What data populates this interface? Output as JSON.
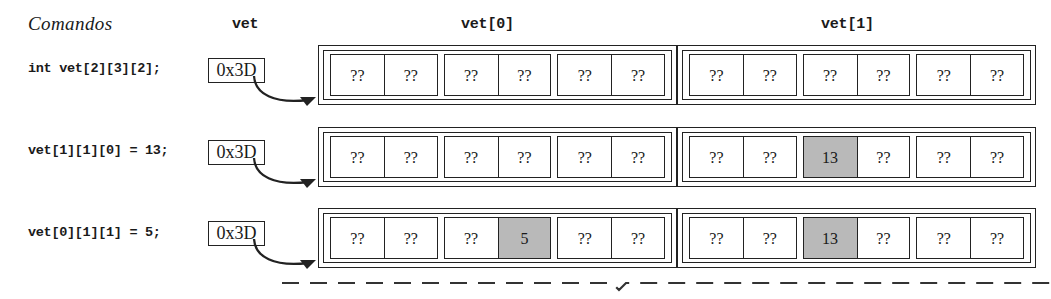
{
  "headers": {
    "commands_label": "Comandos",
    "pointer_label": "vet",
    "block0_label": "vet[0]",
    "block1_label": "vet[1]"
  },
  "colors": {
    "stroke": "#222222",
    "highlight": "#b9b9b9",
    "background": "#ffffff"
  },
  "rows": [
    {
      "command": "int vet[2][3][2];",
      "pointer_value": "0x3D",
      "blocks": [
        {
          "name": "vet[0]",
          "pairs": [
            {
              "cells": [
                {
                  "text": "??",
                  "highlighted": false
                },
                {
                  "text": "??",
                  "highlighted": false
                }
              ]
            },
            {
              "cells": [
                {
                  "text": "??",
                  "highlighted": false
                },
                {
                  "text": "??",
                  "highlighted": false
                }
              ]
            },
            {
              "cells": [
                {
                  "text": "??",
                  "highlighted": false
                },
                {
                  "text": "??",
                  "highlighted": false
                }
              ]
            }
          ]
        },
        {
          "name": "vet[1]",
          "pairs": [
            {
              "cells": [
                {
                  "text": "??",
                  "highlighted": false
                },
                {
                  "text": "??",
                  "highlighted": false
                }
              ]
            },
            {
              "cells": [
                {
                  "text": "??",
                  "highlighted": false
                },
                {
                  "text": "??",
                  "highlighted": false
                }
              ]
            },
            {
              "cells": [
                {
                  "text": "??",
                  "highlighted": false
                },
                {
                  "text": "??",
                  "highlighted": false
                }
              ]
            }
          ]
        }
      ]
    },
    {
      "command": "vet[1][1][0] = 13;",
      "pointer_value": "0x3D",
      "blocks": [
        {
          "name": "vet[0]",
          "pairs": [
            {
              "cells": [
                {
                  "text": "??",
                  "highlighted": false
                },
                {
                  "text": "??",
                  "highlighted": false
                }
              ]
            },
            {
              "cells": [
                {
                  "text": "??",
                  "highlighted": false
                },
                {
                  "text": "??",
                  "highlighted": false
                }
              ]
            },
            {
              "cells": [
                {
                  "text": "??",
                  "highlighted": false
                },
                {
                  "text": "??",
                  "highlighted": false
                }
              ]
            }
          ]
        },
        {
          "name": "vet[1]",
          "pairs": [
            {
              "cells": [
                {
                  "text": "??",
                  "highlighted": false
                },
                {
                  "text": "??",
                  "highlighted": false
                }
              ]
            },
            {
              "cells": [
                {
                  "text": "13",
                  "highlighted": true
                },
                {
                  "text": "??",
                  "highlighted": false
                }
              ]
            },
            {
              "cells": [
                {
                  "text": "??",
                  "highlighted": false
                },
                {
                  "text": "??",
                  "highlighted": false
                }
              ]
            }
          ]
        }
      ]
    },
    {
      "command": "vet[0][1][1] = 5;",
      "pointer_value": "0x3D",
      "blocks": [
        {
          "name": "vet[0]",
          "pairs": [
            {
              "cells": [
                {
                  "text": "??",
                  "highlighted": false
                },
                {
                  "text": "??",
                  "highlighted": false
                }
              ]
            },
            {
              "cells": [
                {
                  "text": "??",
                  "highlighted": false
                },
                {
                  "text": "5",
                  "highlighted": true
                }
              ]
            },
            {
              "cells": [
                {
                  "text": "??",
                  "highlighted": false
                },
                {
                  "text": "??",
                  "highlighted": false
                }
              ]
            }
          ]
        },
        {
          "name": "vet[1]",
          "pairs": [
            {
              "cells": [
                {
                  "text": "??",
                  "highlighted": false
                },
                {
                  "text": "??",
                  "highlighted": false
                }
              ]
            },
            {
              "cells": [
                {
                  "text": "13",
                  "highlighted": true
                },
                {
                  "text": "??",
                  "highlighted": false
                }
              ]
            },
            {
              "cells": [
                {
                  "text": "??",
                  "highlighted": false
                },
                {
                  "text": "??",
                  "highlighted": false
                }
              ]
            }
          ]
        }
      ]
    }
  ]
}
